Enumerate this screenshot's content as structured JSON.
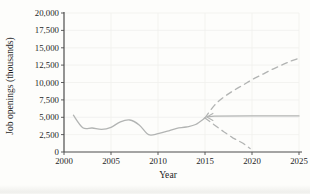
{
  "page": {
    "background": "#fdfdfb"
  },
  "chart_data": {
    "type": "line",
    "title": "",
    "xlabel": "Year",
    "ylabel": "Job openings (thousands)",
    "xlim": [
      2000,
      2025
    ],
    "ylim": [
      0,
      20000
    ],
    "grid": true,
    "legend": "none",
    "x_ticks": [
      2000,
      2005,
      2010,
      2015,
      2020,
      2025
    ],
    "x_tick_labels": [
      "2000",
      "2005",
      "2010",
      "2015",
      "2020",
      "2025"
    ],
    "y_ticks": [
      0,
      2500,
      5000,
      7500,
      10000,
      12500,
      15000,
      17500,
      20000
    ],
    "y_tick_labels": [
      "0",
      "2,500",
      "5,000",
      "7,500",
      "10,000",
      "12,500",
      "15,000",
      "17,500",
      "20,000"
    ],
    "colors": {
      "line": "#b2b4b3",
      "axis": "#4d4d4d",
      "grid": "#f0f0ee",
      "text": "#1f1f1f"
    },
    "series": [
      {
        "name": "historical job openings",
        "style": "solid",
        "smooth": true,
        "arrow_start": false,
        "x": [
          2001,
          2002,
          2003,
          2004,
          2005,
          2006,
          2007,
          2008,
          2009,
          2010,
          2011,
          2012,
          2013,
          2014,
          2015
        ],
        "y": [
          5300,
          3500,
          3450,
          3250,
          3550,
          4350,
          4600,
          3900,
          2500,
          2650,
          3000,
          3400,
          3600,
          3950,
          4900
        ]
      },
      {
        "name": "steady projection",
        "style": "solid",
        "smooth": false,
        "arrow_start": true,
        "x": [
          2015.2,
          2016,
          2020,
          2025
        ],
        "y": [
          5050,
          5150,
          5200,
          5200
        ]
      },
      {
        "name": "optimistic projection",
        "style": "dashed",
        "smooth": true,
        "arrow_start": false,
        "x": [
          2015,
          2016,
          2017,
          2018,
          2019,
          2020,
          2021,
          2022,
          2023,
          2024,
          2025
        ],
        "y": [
          4900,
          6700,
          7900,
          8800,
          9600,
          10400,
          11100,
          11800,
          12400,
          13000,
          13500
        ]
      },
      {
        "name": "pessimistic projection",
        "style": "dashed",
        "smooth": false,
        "arrow_start": false,
        "x": [
          2015,
          2016,
          2017,
          2018,
          2019,
          2019.8
        ],
        "y": [
          4900,
          3900,
          2900,
          2000,
          1300,
          500
        ]
      }
    ]
  }
}
